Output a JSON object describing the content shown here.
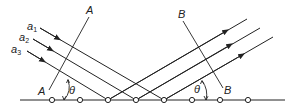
{
  "diagram": {
    "incident_rays": [
      {
        "label": "a",
        "subscript": "1"
      },
      {
        "label": "a",
        "subscript": "2"
      },
      {
        "label": "a",
        "subscript": "3"
      }
    ],
    "wavefront_incident": {
      "top_label": "A",
      "bottom_label": "A"
    },
    "wavefront_reflected": {
      "top_label": "B",
      "bottom_label": "B"
    },
    "angle_left": "θ",
    "angle_right": "θ",
    "lattice_points": 8,
    "line_color": "#222222"
  }
}
